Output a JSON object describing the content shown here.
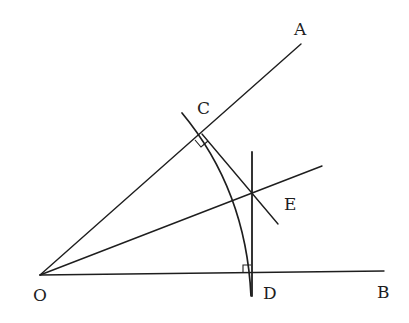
{
  "diagram": {
    "type": "geometric-construction",
    "labels": {
      "O": "O",
      "A": "A",
      "B": "B",
      "C": "C",
      "D": "D",
      "E": "E"
    },
    "points": {
      "O": {
        "x": 40,
        "y": 275
      },
      "A": {
        "x": 301,
        "y": 44
      },
      "B": {
        "x": 384,
        "y": 271
      },
      "C": {
        "x": 202,
        "y": 134
      },
      "D": {
        "x": 252,
        "y": 273
      },
      "E": {
        "x": 253,
        "y": 193
      }
    },
    "right_angle_marks": [
      "C",
      "D"
    ],
    "colors": {
      "stroke": "#1e1e1e",
      "background": "#ffffff"
    }
  }
}
